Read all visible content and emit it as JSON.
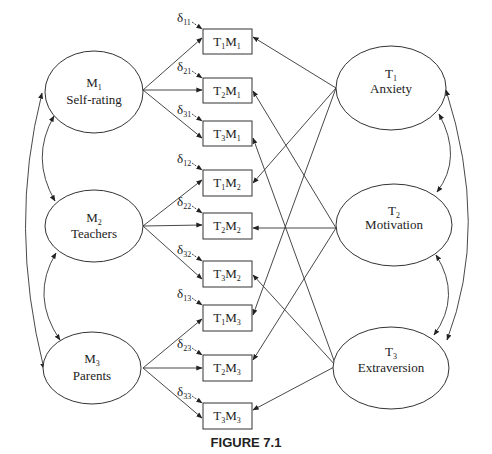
{
  "figure": {
    "caption": "FIGURE 7.1"
  },
  "methods": [
    {
      "id": "M1",
      "symbol": "M",
      "sub": "1",
      "name": "Self-rating"
    },
    {
      "id": "M2",
      "symbol": "M",
      "sub": "2",
      "name": "Teachers"
    },
    {
      "id": "M3",
      "symbol": "M",
      "sub": "3",
      "name": "Parents"
    }
  ],
  "traits": [
    {
      "id": "T1",
      "symbol": "T",
      "sub": "1",
      "name": "Anxiety"
    },
    {
      "id": "T2",
      "symbol": "T",
      "sub": "2",
      "name": "Motivation"
    },
    {
      "id": "T3",
      "symbol": "T",
      "sub": "3",
      "name": "Extraversion"
    }
  ],
  "indicators": [
    {
      "id": "T1M1",
      "t": "1",
      "m": "1",
      "error": "δ",
      "error_sub": "11"
    },
    {
      "id": "T2M1",
      "t": "2",
      "m": "1",
      "error": "δ",
      "error_sub": "21"
    },
    {
      "id": "T3M1",
      "t": "3",
      "m": "1",
      "error": "δ",
      "error_sub": "31"
    },
    {
      "id": "T1M2",
      "t": "1",
      "m": "2",
      "error": "δ",
      "error_sub": "12"
    },
    {
      "id": "T2M2",
      "t": "2",
      "m": "2",
      "error": "δ",
      "error_sub": "22"
    },
    {
      "id": "T3M2",
      "t": "3",
      "m": "2",
      "error": "δ",
      "error_sub": "32"
    },
    {
      "id": "T1M3",
      "t": "1",
      "m": "3",
      "error": "δ",
      "error_sub": "13"
    },
    {
      "id": "T2M3",
      "t": "2",
      "m": "3",
      "error": "δ",
      "error_sub": "23"
    },
    {
      "id": "T3M3",
      "t": "3",
      "m": "3",
      "error": "δ",
      "error_sub": "33"
    }
  ],
  "letters": {
    "T": "T",
    "M": "M"
  },
  "edges": {
    "method_loadings": "Each method factor M points to its three indicator boxes",
    "trait_loadings": "Each trait factor T points to the three boxes sharing its trait index",
    "covariances": "Double-headed curved arrows among M1,M2,M3 and among T1,T2,T3"
  }
}
